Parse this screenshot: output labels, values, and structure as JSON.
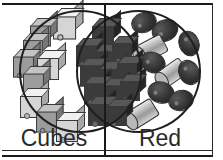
{
  "diagram": {
    "type": "venn",
    "title": "",
    "set_left": {
      "label": "Cubes",
      "description": "cube shaped objects"
    },
    "set_right": {
      "label": "Red",
      "description": "red colored objects"
    },
    "regions": {
      "left_only": {
        "name": "cubes-not-red",
        "shape": "cube",
        "shade": "light",
        "count": 9
      },
      "intersection": {
        "name": "cubes-and-red",
        "shape": "cube",
        "shade": "dark",
        "count": 12
      },
      "right_only": {
        "name": "red-not-cubes",
        "shape": "cylinder",
        "shade": "dark",
        "count": 10
      }
    },
    "colors": {
      "outline": "#1f1f1f",
      "frame": "#1a1a1a",
      "label_text": "#2a2a2a",
      "light_object": "#d5d5d5",
      "mid_object": "#9c9c9c",
      "dark_object": "#3b3b3b",
      "background": "#ffffff"
    }
  },
  "objects": {
    "left_cubes": [
      {
        "id": "cube-l1",
        "x": 53,
        "y": 8,
        "scale": 1.05,
        "shade": "light"
      },
      {
        "id": "cube-l2",
        "x": 30,
        "y": 18,
        "scale": 0.95,
        "shade": "mid"
      },
      {
        "id": "cube-l3",
        "x": 23,
        "y": 33,
        "scale": 0.9,
        "shade": "mid"
      },
      {
        "id": "cube-l4",
        "x": 13,
        "y": 49,
        "scale": 0.95,
        "shade": "mid"
      },
      {
        "id": "cube-l5",
        "x": 37,
        "y": 50,
        "scale": 1.0,
        "shade": "light"
      },
      {
        "id": "cube-l6",
        "x": 23,
        "y": 66,
        "scale": 0.95,
        "shade": "mid"
      },
      {
        "id": "cube-l7",
        "x": 20,
        "y": 88,
        "scale": 1.0,
        "shade": "light"
      },
      {
        "id": "cube-l8",
        "x": 36,
        "y": 104,
        "scale": 0.95,
        "shade": "mid"
      },
      {
        "id": "cube-l9",
        "x": 56,
        "y": 112,
        "scale": 1.0,
        "shade": "light"
      }
    ],
    "intersection_cubes": [
      {
        "id": "cube-i1",
        "x": 92,
        "y": 18,
        "scale": 1.0,
        "shade": "dark"
      },
      {
        "id": "cube-i2",
        "x": 76,
        "y": 38,
        "scale": 0.95,
        "shade": "dark"
      },
      {
        "id": "cube-i3",
        "x": 95,
        "y": 44,
        "scale": 0.95,
        "shade": "dark"
      },
      {
        "id": "cube-i4",
        "x": 112,
        "y": 36,
        "scale": 0.9,
        "shade": "dark"
      },
      {
        "id": "cube-i5",
        "x": 80,
        "y": 58,
        "scale": 0.95,
        "shade": "dark"
      },
      {
        "id": "cube-i6",
        "x": 99,
        "y": 61,
        "scale": 1.0,
        "shade": "dark"
      },
      {
        "id": "cube-i7",
        "x": 117,
        "y": 56,
        "scale": 0.9,
        "shade": "dark"
      },
      {
        "id": "cube-i8",
        "x": 84,
        "y": 76,
        "scale": 0.95,
        "shade": "dark"
      },
      {
        "id": "cube-i9",
        "x": 103,
        "y": 78,
        "scale": 0.95,
        "shade": "dark"
      },
      {
        "id": "cube-i10",
        "x": 120,
        "y": 74,
        "scale": 0.9,
        "shade": "dark"
      },
      {
        "id": "cube-i11",
        "x": 88,
        "y": 96,
        "scale": 1.0,
        "shade": "dark"
      },
      {
        "id": "cube-i12",
        "x": 107,
        "y": 99,
        "scale": 0.9,
        "shade": "dark"
      }
    ],
    "right_cylinders": [
      {
        "id": "cyl-r1",
        "x": 131,
        "y": 12,
        "rot": -20,
        "scale": 1.0,
        "shade": "dark",
        "kind": "blob"
      },
      {
        "id": "cyl-r2",
        "x": 152,
        "y": 20,
        "rot": -25,
        "scale": 1.05,
        "shade": "dark",
        "kind": "blob"
      },
      {
        "id": "cyl-r3",
        "x": 176,
        "y": 33,
        "rot": 70,
        "scale": 1.0,
        "shade": "dark",
        "kind": "blob"
      },
      {
        "id": "cyl-r4",
        "x": 137,
        "y": 40,
        "rot": -28,
        "scale": 1.05,
        "shade": "light",
        "kind": "cyl"
      },
      {
        "id": "cyl-r5",
        "x": 140,
        "y": 52,
        "rot": 25,
        "scale": 1.0,
        "shade": "dark",
        "kind": "blob"
      },
      {
        "id": "cyl-r6",
        "x": 158,
        "y": 64,
        "rot": -35,
        "scale": 1.0,
        "shade": "light",
        "kind": "cyl"
      },
      {
        "id": "cyl-r7",
        "x": 176,
        "y": 62,
        "rot": 65,
        "scale": 1.0,
        "shade": "dark",
        "kind": "blob"
      },
      {
        "id": "cyl-r8",
        "x": 148,
        "y": 82,
        "rot": 15,
        "scale": 1.05,
        "shade": "dark",
        "kind": "blob"
      },
      {
        "id": "cyl-r9",
        "x": 168,
        "y": 90,
        "rot": -15,
        "scale": 1.0,
        "shade": "dark",
        "kind": "blob"
      },
      {
        "id": "cyl-r10",
        "x": 128,
        "y": 105,
        "rot": -32,
        "scale": 1.05,
        "shade": "light",
        "kind": "cyl"
      }
    ]
  }
}
